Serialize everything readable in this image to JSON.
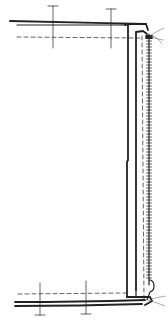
{
  "diagram": {
    "colors": {
      "background": "#ffffff",
      "ink": "#222222",
      "thread": "#555555"
    },
    "elements": {
      "top_fabric_edge": "top-fabric-layers",
      "bottom_fabric_edge": "bottom-fabric-layers",
      "zipper_tape": "zipper-tape",
      "zipper_teeth": "zipper-teeth",
      "stitch_lines": [
        "top-stitch-line",
        "bottom-stitch-line",
        "zipper-stitch-line"
      ],
      "measurement_markers": 4
    }
  }
}
